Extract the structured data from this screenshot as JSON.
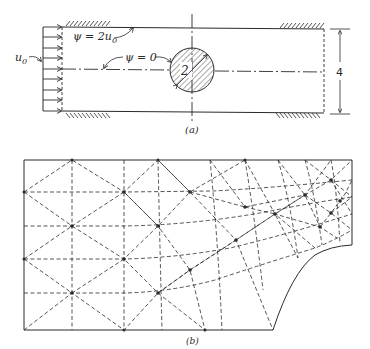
{
  "figure_a": {
    "caption": "(a)",
    "inlet_label": "u",
    "inlet_label_sub": "0",
    "top_wall_label": "ψ = 2u",
    "top_wall_label_sub": "0",
    "centerline_label": "ψ = 0",
    "cylinder_diameter_label": "2",
    "channel_height_label": "4"
  },
  "figure_b": {
    "caption": "(b)"
  },
  "colors": {
    "ink": "#2a2a2a",
    "background": "#ffffff"
  }
}
